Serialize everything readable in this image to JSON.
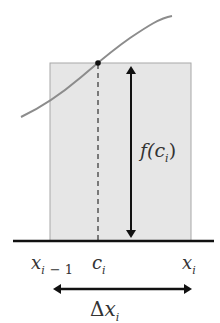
{
  "diagram": {
    "labels": {
      "height_label": {
        "main": "f(c",
        "sub": "i",
        "close": ")"
      },
      "left_endpoint": {
        "main": "x",
        "sub": "i",
        "suffix": "− 1"
      },
      "sample_point": {
        "main": "c",
        "sub": "i"
      },
      "right_endpoint": {
        "main": "x",
        "sub": "i"
      },
      "width_label": {
        "delta": "Δ",
        "main": "x",
        "sub": "i"
      }
    },
    "colors": {
      "rectangle_fill": "#e6e6e6",
      "rectangle_stroke": "#a8a8a8",
      "curve": "#8c8c8c",
      "axis": "#111111",
      "arrow": "#111111",
      "dashed_line": "#555555",
      "text": "#333333"
    }
  }
}
